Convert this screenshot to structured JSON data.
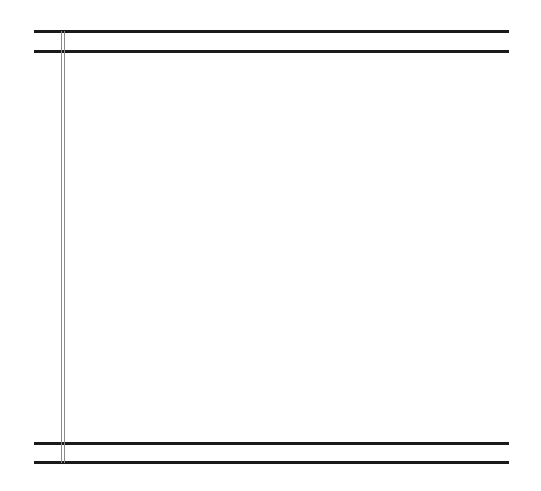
{
  "canvas": {
    "width": 541,
    "height": 491,
    "background": "#ffffff"
  },
  "lines": {
    "color": "#1a1a1a",
    "vertical_color": "#8a8a8a",
    "horizontal": [
      {
        "name": "top-rule-1",
        "y": 30
      },
      {
        "name": "top-rule-2",
        "y": 50
      },
      {
        "name": "bottom-rule-1",
        "y": 442
      },
      {
        "name": "bottom-rule-2",
        "y": 461
      }
    ],
    "vertical": [
      {
        "name": "margin-rule-left",
        "x": 61
      },
      {
        "name": "margin-rule-right",
        "x": 64
      }
    ]
  }
}
